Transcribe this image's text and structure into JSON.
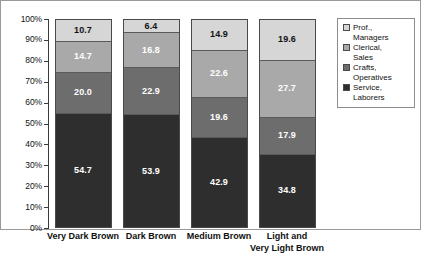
{
  "chart_data": {
    "type": "bar",
    "subtype": "stacked-bar-100-percent",
    "title": "",
    "xlabel": "",
    "ylabel": "",
    "ylim": [
      0,
      100
    ],
    "ytick_labels": [
      "100%",
      "90%",
      "80%",
      "70%",
      "60%",
      "50%",
      "40%",
      "30%",
      "20%",
      "10%",
      "0%"
    ],
    "ytick_values": [
      100,
      90,
      80,
      70,
      60,
      50,
      40,
      30,
      20,
      10,
      0
    ],
    "grid": false,
    "legend_position": "right",
    "categories": [
      "Very Dark Brown",
      "Dark Brown",
      "Medium Brown",
      "Light and\nVery Light Brown"
    ],
    "series": [
      {
        "name": "Prof.,\nManagers",
        "legend_label": "Prof.,\nManagers",
        "color": "#d6d6d6",
        "label_color": "#111111",
        "values": [
          10.7,
          6.4,
          14.9,
          19.6
        ],
        "value_labels": [
          "10.7",
          "6.4",
          "14.9",
          "19.6"
        ]
      },
      {
        "name": "Clerical,\nSales",
        "legend_label": "Clerical,\nSales",
        "color": "#a9a9a9",
        "label_color": "#ffffff",
        "values": [
          14.7,
          16.8,
          22.6,
          27.7
        ],
        "value_labels": [
          "14.7",
          "16.8",
          "22.6",
          "27.7"
        ]
      },
      {
        "name": "Crafts,\nOperatives",
        "legend_label": "Crafts,\nOperatives",
        "color": "#6d6d6d",
        "label_color": "#ffffff",
        "values": [
          20.0,
          22.9,
          19.6,
          17.9
        ],
        "value_labels": [
          "20.0",
          "22.9",
          "19.6",
          "17.9"
        ]
      },
      {
        "name": "Service,\nLaborers",
        "legend_label": "Service,\nLaborers",
        "color": "#2e2e2e",
        "label_color": "#ffffff",
        "values": [
          54.7,
          53.9,
          42.9,
          34.8
        ],
        "value_labels": [
          "54.7",
          "53.9",
          "42.9",
          "34.8"
        ]
      }
    ]
  }
}
